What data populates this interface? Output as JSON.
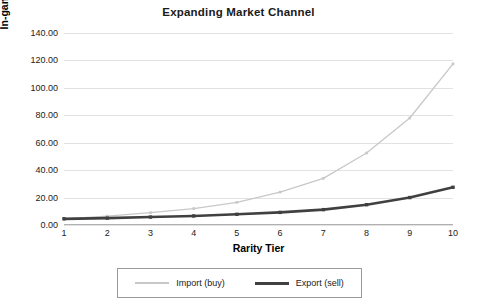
{
  "chart_data": {
    "type": "line",
    "title": "Expanding Market Channel",
    "xlabel": "Rarity Tier",
    "ylabel": "In-game Pricing",
    "categories": [
      1,
      2,
      3,
      4,
      5,
      6,
      7,
      8,
      9,
      10
    ],
    "x": [
      1,
      2,
      3,
      4,
      5,
      6,
      7,
      8,
      9,
      10
    ],
    "xtick_labels": [
      "1",
      "2",
      "3",
      "4",
      "5",
      "6",
      "7",
      "8",
      "9",
      "10"
    ],
    "ytick_labels": [
      "0.00",
      "20.00",
      "40.00",
      "60.00",
      "80.00",
      "100.00",
      "120.00",
      "140.00"
    ],
    "ytick_values": [
      0,
      20,
      40,
      60,
      80,
      100,
      120,
      140
    ],
    "ylim": [
      0,
      140
    ],
    "xlim": [
      1,
      10
    ],
    "grid": "horizontal",
    "legend_position": "bottom",
    "markers": "square",
    "series": [
      {
        "name": "Import (buy)",
        "color": "#c8c8c8",
        "line_width": 1.3,
        "values": [
          4.5,
          6.5,
          9.0,
          12.0,
          16.5,
          24.0,
          34.0,
          52.5,
          78.0,
          117.5
        ]
      },
      {
        "name": "Export (sell)",
        "color": "#404040",
        "line_width": 2.6,
        "values": [
          4.5,
          5.0,
          5.8,
          6.6,
          7.8,
          9.2,
          11.2,
          14.8,
          20.0,
          27.5
        ]
      }
    ]
  },
  "legend": {
    "items": [
      {
        "label": "Import (buy)"
      },
      {
        "label": "Export (sell)"
      }
    ]
  },
  "colors": {
    "import_line": "#c8c8c8",
    "export_line": "#404040",
    "gridline": "#e2e2e2",
    "axis": "#b0b0b0",
    "background": "#ffffff",
    "text": "#222222"
  }
}
